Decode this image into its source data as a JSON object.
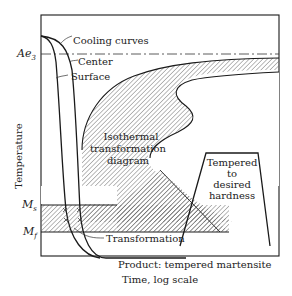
{
  "diagram": {
    "type": "TTT diagram - tempering of martensite",
    "axes": {
      "y_label": "Temperature",
      "x_label": "Time, log scale",
      "y_levels": {
        "ae3": "Ae",
        "ae3_sub": "3",
        "ms": "M",
        "ms_sub": "s",
        "mf": "M",
        "mf_sub": "f"
      }
    },
    "labels": {
      "cooling_curves": "Cooling curves",
      "center": "Center",
      "surface": "Surface",
      "isothermal_1": "Isothermal",
      "isothermal_2": "transformation",
      "isothermal_3": "diagram",
      "tempered_1": "Tempered",
      "tempered_2": "to",
      "tempered_3": "desired",
      "tempered_4": "hardness",
      "transformation": "Transformation",
      "product": "Product: tempered martensite"
    },
    "colors": {
      "line": "#1a1a1a",
      "hatch": "#555555",
      "background": "#ffffff"
    }
  }
}
